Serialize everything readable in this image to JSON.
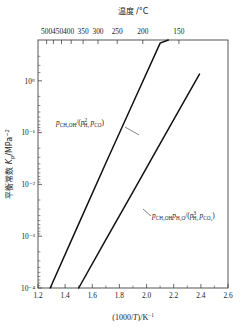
{
  "chart_data": {
    "type": "line",
    "title": "",
    "xlabel": "(1000/T)/K⁻¹",
    "ylabel": "平衡常数 Kₚ/MPa⁻²",
    "top_axis_label": "温度 /°C",
    "xlim": [
      1.2,
      2.6
    ],
    "ylim_log10": [
      -4,
      0.72
    ],
    "yscale": "log",
    "grid": false,
    "legend_position": "inline-annotations",
    "x_ticks": [
      "1.2",
      "1.4",
      "1.6",
      "1.8",
      "2.0",
      "2.2",
      "2.4",
      "2.6"
    ],
    "x_tick_values": [
      1.2,
      1.4,
      1.6,
      1.8,
      2.0,
      2.2,
      2.4,
      2.6
    ],
    "y_ticks": [
      "10⁰",
      "10⁻¹",
      "10⁻²",
      "10⁻³",
      "10⁻⁴"
    ],
    "y_tick_exponents": [
      0,
      -1,
      -2,
      -3,
      -4
    ],
    "top_ticks": [
      "500",
      "450",
      "400",
      "350",
      "300",
      "250",
      "200",
      "150"
    ],
    "top_tick_celsius": [
      500,
      450,
      400,
      350,
      300,
      250,
      200,
      150
    ],
    "series": [
      {
        "name": "p_CH3OH/(p^2_H2 p_CO)",
        "label_parts": {
          "p1": "p",
          "sub1": "CH₃OH",
          "mid": "/(",
          "p2": "p",
          "sup2": "2",
          "sub2": "H₂",
          "p3": "p",
          "sub3": "CO",
          "close": ")"
        },
        "x": [
          1.29,
          1.5,
          1.7,
          1.9,
          2.1,
          2.16
        ],
        "y_log10": [
          -4.0,
          -2.78,
          -1.62,
          -0.48,
          0.66,
          0.72
        ]
      },
      {
        "name": "p_CH3OH p_H2O/(p^3_H2 p_CO2)",
        "label_parts": {
          "p1": "p",
          "sub1": "CH₃OH",
          "p2": "p",
          "sub2": "H₂O",
          "mid": "/(",
          "p3": "p",
          "sup3": "3",
          "sub3": "H₂",
          "p4": "p",
          "sub4": "CO₂",
          "close": ")"
        },
        "x": [
          1.5,
          1.7,
          1.9,
          2.1,
          2.3,
          2.39
        ],
        "y_log10": [
          -4.0,
          -3.08,
          -2.17,
          -1.25,
          -0.34,
          0.07
        ]
      }
    ]
  },
  "axes": {
    "x_title": "(1000/T)/K⁻¹",
    "x_title_parts": {
      "pre": "(1000/",
      "ital": "T",
      "post": ")/K",
      "sup": "−1"
    },
    "y_title_parts": {
      "pre": "平衡常数 ",
      "ital": "K",
      "sub": "p",
      "post": "/MPa",
      "sup": "−2"
    },
    "top_title": "温度 /°C"
  },
  "colors": {
    "curve": "#111111",
    "frame": "#444444",
    "background": "#ffffff",
    "text": "#1a1a1a"
  }
}
